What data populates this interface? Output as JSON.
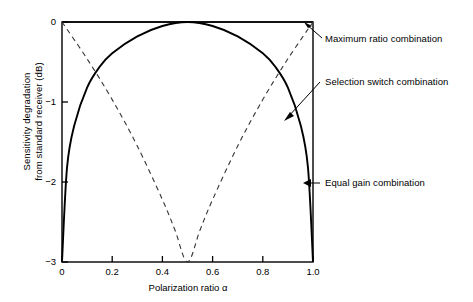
{
  "chart_data": {
    "type": "line",
    "title": "",
    "xlabel": "Polarization ratio α",
    "ylabel_line1": "Sensitivity degradation",
    "ylabel_line2": "from standard receiver (dB)",
    "xlim": [
      0,
      1.0
    ],
    "ylim": [
      -3,
      0
    ],
    "grid": false,
    "legend_position": "annotations-right",
    "xticks": [
      "0",
      "0.2",
      "0.4",
      "0.6",
      "0.8",
      "1.0"
    ],
    "xtick_values": [
      0,
      0.2,
      0.4,
      0.6,
      0.8,
      1.0
    ],
    "yticks": [
      "0",
      "−1",
      "−2",
      "−3"
    ],
    "ytick_values": [
      0,
      -1,
      -2,
      -3
    ],
    "series": [
      {
        "name": "Maximum ratio combination",
        "style": "solid",
        "x": [
          0,
          0.1,
          0.2,
          0.3,
          0.4,
          0.5,
          0.6,
          0.7,
          0.8,
          0.9,
          1.0
        ],
        "values": [
          0,
          0,
          0,
          0,
          0,
          0,
          0,
          0,
          0,
          0,
          0
        ]
      },
      {
        "name": "Selection switch combination",
        "style": "dashed",
        "x": [
          0,
          0.1,
          0.2,
          0.3,
          0.4,
          0.45,
          0.5,
          0.55,
          0.6,
          0.7,
          0.8,
          0.9,
          1.0
        ],
        "values": [
          0,
          -0.46,
          -0.97,
          -1.55,
          -2.22,
          -2.6,
          -3.0,
          -2.6,
          -2.22,
          -1.55,
          -0.97,
          -0.46,
          0
        ]
      },
      {
        "name": "Equal gain combination",
        "style": "solid",
        "x": [
          0,
          0.02,
          0.05,
          0.1,
          0.15,
          0.2,
          0.3,
          0.4,
          0.5,
          0.6,
          0.7,
          0.8,
          0.85,
          0.9,
          0.95,
          0.98,
          1.0
        ],
        "values": [
          -3.0,
          -1.82,
          -1.28,
          -0.82,
          -0.56,
          -0.39,
          -0.18,
          -0.05,
          0,
          -0.05,
          -0.18,
          -0.39,
          -0.56,
          -0.82,
          -1.28,
          -1.82,
          -3.0
        ]
      }
    ],
    "annotations": [
      {
        "label": "Maximum ratio combination",
        "target_x": 1.0,
        "target_y": 0
      },
      {
        "label": "Selection switch combination",
        "target_x": 0.885,
        "target_y": -1.16
      },
      {
        "label": "Equal gain combination",
        "target_x": 0.975,
        "target_y": -2.0
      }
    ]
  }
}
